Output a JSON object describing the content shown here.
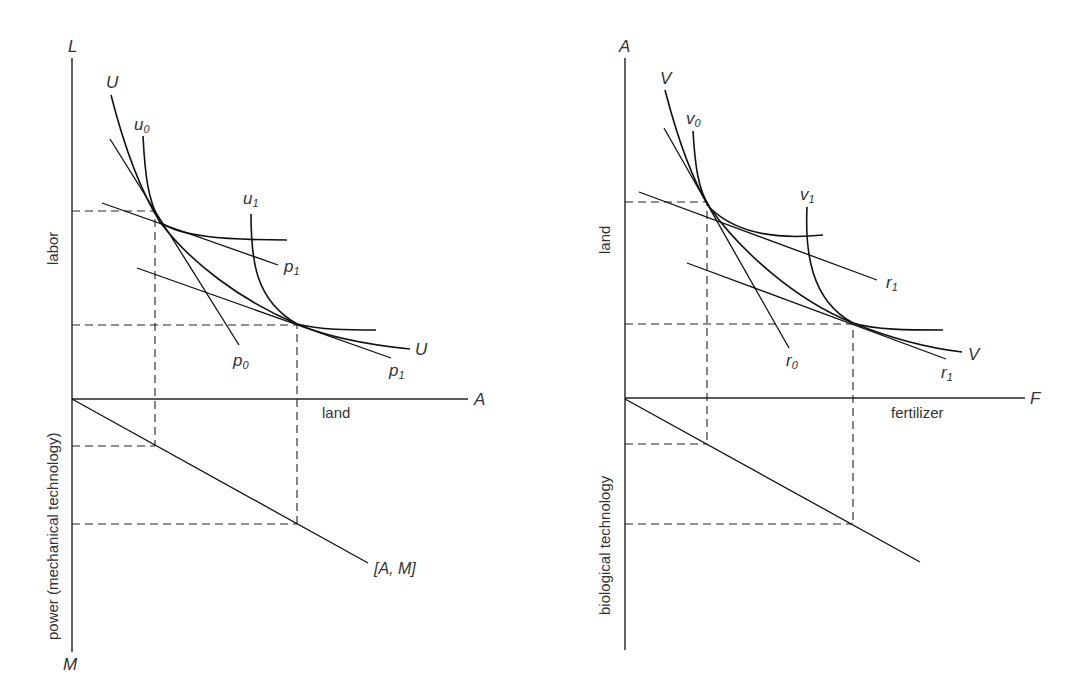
{
  "left_panel": {
    "y_axis_top_symbol": "L",
    "x_axis_symbol": "A",
    "y_axis_bottom_symbol": "M",
    "y_axis_upper_label": "labor",
    "y_axis_lower_label": "power (mechanical technology)",
    "x_axis_label": "land",
    "curve_labels": {
      "U_top": "U",
      "U_right": "U",
      "u0": "u",
      "u0_sub": "0",
      "u1": "u",
      "u1_sub": "1",
      "p0": "p",
      "p0_sub": "0",
      "p1_upper": "p",
      "p1_upper_sub": "1",
      "p1_lower": "p",
      "p1_lower_sub": "1"
    },
    "ray_label": "[A, M]"
  },
  "right_panel": {
    "y_axis_top_symbol": "A",
    "x_axis_symbol": "F",
    "y_axis_upper_label": "land",
    "y_axis_lower_label": "biological technology",
    "x_axis_label": "fertilizer",
    "curve_labels": {
      "V_top": "V",
      "V_right": "V",
      "v0": "v",
      "v0_sub": "0",
      "v1": "v",
      "v1_sub": "1",
      "r0": "r",
      "r0_sub": "0",
      "r1_upper": "r",
      "r1_upper_sub": "1",
      "r1_lower": "r",
      "r1_lower_sub": "1"
    }
  }
}
